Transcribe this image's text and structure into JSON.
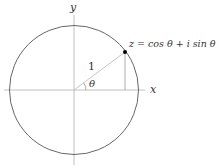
{
  "diagram": {
    "axes": {
      "x_label": "x",
      "y_label": "y"
    },
    "circle": {
      "center": [
        74,
        90
      ],
      "radius": 65,
      "stroke_color": "#555555"
    },
    "radius_label": "1",
    "angle_label": "θ",
    "point": {
      "position": [
        125,
        52
      ],
      "color": "#000000",
      "label": "z = cos θ + i sin θ"
    },
    "colors": {
      "axis": "#b0b0b0",
      "radius_line": "#b8b8b8",
      "drop_line": "#999999",
      "text": "#333333"
    }
  }
}
